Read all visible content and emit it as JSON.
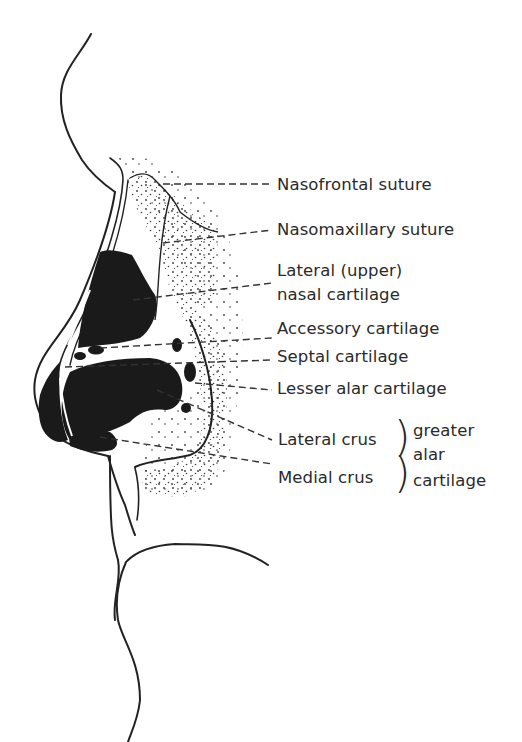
{
  "figure": {
    "colors": {
      "line": "#222222",
      "cartilage_fill": "#1a1a1a",
      "stipple": "#3a3a3a",
      "text": "#2a2a2a",
      "background": "#ffffff"
    }
  },
  "labels": [
    {
      "id": "nasofrontal",
      "text": "Nasofrontal suture"
    },
    {
      "id": "nasomaxillary",
      "text": "Nasomaxillary suture"
    },
    {
      "id": "lateral_upper_1",
      "text": "Lateral (upper)"
    },
    {
      "id": "lateral_upper_2",
      "text": "nasal cartilage"
    },
    {
      "id": "accessory",
      "text": "Accessory cartilage"
    },
    {
      "id": "septal",
      "text": "Septal cartilage"
    },
    {
      "id": "lesser_alar",
      "text": "Lesser alar cartilage"
    },
    {
      "id": "lateral_crus",
      "text": "Lateral crus"
    },
    {
      "id": "medial_crus",
      "text": "Medial crus"
    }
  ],
  "group_label": {
    "lines": [
      "greater",
      "alar",
      "cartilage"
    ],
    "brace": ")"
  }
}
